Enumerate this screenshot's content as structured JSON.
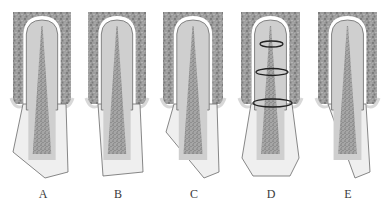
{
  "figure": {
    "type": "dental-root-fracture-diagram",
    "panel_count": 5,
    "colors": {
      "bone": "#9a9a9a",
      "bone_speckle_dark": "#6e6e6e",
      "bone_speckle_light": "#bdbdbd",
      "ligament_gap": "#ffffff",
      "dentin": "#cfcfcf",
      "enamel": "#efefef",
      "pulp": "#a8a8a8",
      "pulp_speckle": "#555555",
      "outline": "#6a6a6a",
      "ring": "#222222"
    },
    "panels": [
      {
        "id": "A",
        "label": "A",
        "label_x": 43,
        "bone": {
          "x": 13,
          "y": 12,
          "w": 58,
          "h": 96
        },
        "root_tip": [
          42,
          20
        ],
        "crown": "M23,104 L13,152 L45,178 L68,172 L66,104 Z",
        "description": "crown fracture with missing incisal corner on the labial side"
      },
      {
        "id": "B",
        "label": "B",
        "label_x": 118,
        "bone": {
          "x": 88,
          "y": 12,
          "w": 58,
          "h": 96
        },
        "root_tip": [
          117,
          20
        ],
        "crown": "M98,104 L103,176 L143,172 L140,104 Z",
        "description": "crown fracture with a shortened, straight incisal edge"
      },
      {
        "id": "C",
        "label": "C",
        "label_x": 194,
        "bone": {
          "x": 163,
          "y": 12,
          "w": 60,
          "h": 96
        },
        "root_tip": [
          193,
          20
        ],
        "crown": "M174,104 L166,132 L204,178 L219,172 L217,104 Z",
        "description": "oblique crown-root fracture"
      },
      {
        "id": "D",
        "label": "D",
        "label_x": 271,
        "bone": {
          "x": 241,
          "y": 12,
          "w": 59,
          "h": 96
        },
        "root_tip": [
          271,
          20
        ],
        "crown": "M251,104 L242,158 L253,176 L290,176 L299,158 L292,104 Z",
        "rings": [
          {
            "cx": 271.5,
            "cy": 44,
            "rx": 11.5,
            "ry": 3
          },
          {
            "cx": 272,
            "cy": 72,
            "rx": 16,
            "ry": 3.5
          },
          {
            "cx": 272.5,
            "cy": 103,
            "rx": 19.5,
            "ry": 4
          }
        ],
        "description": "horizontal root fractures at apical, middle and cervical thirds"
      },
      {
        "id": "E",
        "label": "E",
        "label_x": 348,
        "bone": {
          "x": 318,
          "y": 12,
          "w": 59,
          "h": 96
        },
        "root_tip": [
          346,
          20
        ],
        "crown": "M328,104 L355,178 L370,172 L366,104 Z",
        "description": "vertical/longitudinal crown-root fracture"
      }
    ]
  }
}
